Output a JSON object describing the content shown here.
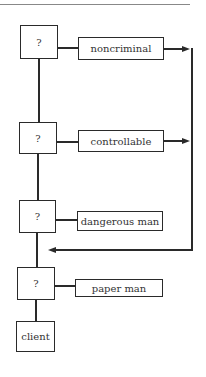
{
  "diagram": {
    "decision_nodes": [
      {
        "label": "?"
      },
      {
        "label": "?"
      },
      {
        "label": "?"
      },
      {
        "label": "?"
      }
    ],
    "outcomes": [
      {
        "label": "noncriminal",
        "arrow": "to-return-line"
      },
      {
        "label": "controllable",
        "arrow": "to-return-line"
      },
      {
        "label": "dangerous man",
        "arrow": "none"
      },
      {
        "label": "paper man",
        "arrow": "none"
      }
    ],
    "terminal": {
      "label": "client"
    },
    "colors": {
      "stroke": "#2a2a2a",
      "text": "#333333",
      "background": "#ffffff"
    }
  }
}
